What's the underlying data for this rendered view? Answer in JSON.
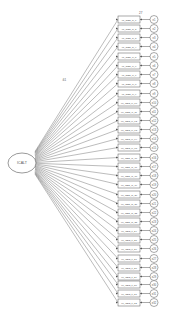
{
  "diagram": {
    "type": "confirmatory-factor-analysis path diagram",
    "latent": {
      "label": "ICALT",
      "cx": 22,
      "cy": 163,
      "rx": 14,
      "ry": 10
    },
    "top_value_label": "27",
    "loading_label_top": ".61",
    "indicator_prefix": "MI_OBS",
    "indicators": [
      {
        "label": "MI_OBS_sl_1",
        "error": "e1",
        "y": 16
      },
      {
        "label": "MI_OBS_sl_2",
        "error": "e2",
        "y": 25
      },
      {
        "label": "MI_OBS_sl_3",
        "error": "e3",
        "y": 34
      },
      {
        "label": "MI_OBS_sl_4",
        "error": "e4",
        "y": 43
      },
      {
        "label": "MI_OBS_cl_5",
        "error": "e5",
        "y": 53
      },
      {
        "label": "MI_OBS_cl_6",
        "error": "e6",
        "y": 62
      },
      {
        "label": "MI_OBS_cl_7",
        "error": "e7",
        "y": 71
      },
      {
        "label": "MI_OBS_cl_8",
        "error": "e8",
        "y": 80
      },
      {
        "label": "MI_OBS_ci_9",
        "error": "e9",
        "y": 90
      },
      {
        "label": "MI_OBS_ci_10",
        "error": "e10",
        "y": 99
      },
      {
        "label": "MI_OBS_ci_11",
        "error": "e11",
        "y": 108
      },
      {
        "label": "MI_OBS_ci_12",
        "error": "e12",
        "y": 117
      },
      {
        "label": "MI_OBS_ci_13",
        "error": "e13",
        "y": 126
      },
      {
        "label": "MI_OBS_ci_14",
        "error": "e14",
        "y": 135
      },
      {
        "label": "MI_OBS_ci_15",
        "error": "e15",
        "y": 144
      },
      {
        "label": "MI_OBS_ai_16",
        "error": "e16",
        "y": 154
      },
      {
        "label": "MI_OBS_ai_17",
        "error": "e17",
        "y": 163
      },
      {
        "label": "MI_OBS_ai_18",
        "error": "e18",
        "y": 172
      },
      {
        "label": "MI_OBS_ai_19",
        "error": "e19",
        "y": 181
      },
      {
        "label": "MI_OBS_di_20",
        "error": "e20",
        "y": 191
      },
      {
        "label": "MI_OBS_di_21",
        "error": "e21",
        "y": 200
      },
      {
        "label": "MI_OBS_di_22",
        "error": "e22",
        "y": 209
      },
      {
        "label": "MI_OBS_di_23",
        "error": "e23",
        "y": 218
      },
      {
        "label": "MI_OBS_tl_24",
        "error": "e24",
        "y": 227
      },
      {
        "label": "MI_OBS_tl_25",
        "error": "e25",
        "y": 236
      },
      {
        "label": "MI_OBS_tl_26",
        "error": "e26",
        "y": 245
      },
      {
        "label": "MI_OBS_tl_27",
        "error": "e27",
        "y": 255
      },
      {
        "label": "MI_OBS_tl_28",
        "error": "e28",
        "y": 264
      },
      {
        "label": "MI_OBS_tl_29",
        "error": "e29",
        "y": 273
      },
      {
        "label": "MI_OBS_tl_30",
        "error": "e30",
        "y": 281
      },
      {
        "label": "MI_OBS_tl_31",
        "error": "e31",
        "y": 290
      },
      {
        "label": "MI_OBS_tl_32",
        "error": "e32",
        "y": 299
      }
    ],
    "box": {
      "x": 118,
      "w": 22,
      "h": 7
    },
    "error_circle": {
      "cx": 154,
      "r": 4
    },
    "colors": {
      "stroke": "#555555",
      "text": "#555555",
      "background": "#ffffff"
    }
  }
}
